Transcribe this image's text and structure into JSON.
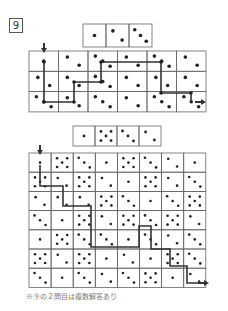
{
  "problem": {
    "number": "9",
    "caption": "※⑨の２問目は複数解答あり"
  },
  "colors": {
    "grid": "#666666",
    "dot": "#222222",
    "path": "#333333"
  },
  "puzzle1": {
    "sequence": [
      1,
      2,
      3
    ],
    "grid": {
      "cols": 6,
      "rows": 3,
      "cells": [
        [
          1,
          2,
          3,
          2,
          3,
          2
        ],
        [
          2,
          2,
          3,
          2,
          2,
          2
        ],
        [
          3,
          2,
          3,
          2,
          3,
          3
        ]
      ]
    },
    "path": [
      [
        0,
        0
      ],
      [
        1,
        0
      ],
      [
        2,
        0
      ],
      [
        2,
        1
      ],
      [
        1,
        2
      ],
      [
        2,
        2
      ],
      [
        1,
        3
      ],
      [
        0,
        3
      ],
      [
        0,
        4
      ],
      [
        1,
        4
      ],
      [
        1,
        5
      ],
      [
        2,
        5
      ]
    ]
  },
  "puzzle2": {
    "sequence": [
      1,
      5,
      3,
      2
    ],
    "grid": {
      "cols": 8,
      "rows": 7,
      "cells": [
        [
          1,
          5,
          3,
          1,
          5,
          3,
          2,
          1
        ],
        [
          5,
          2,
          5,
          2,
          1,
          5,
          2,
          3
        ],
        [
          2,
          2,
          2,
          5,
          3,
          1,
          3,
          5
        ],
        [
          3,
          1,
          5,
          2,
          5,
          3,
          5,
          2
        ],
        [
          1,
          5,
          3,
          3,
          1,
          3,
          2,
          3
        ],
        [
          5,
          2,
          5,
          1,
          2,
          1,
          5,
          3
        ],
        [
          3,
          1,
          3,
          2,
          3,
          5,
          1,
          2
        ]
      ]
    }
  }
}
